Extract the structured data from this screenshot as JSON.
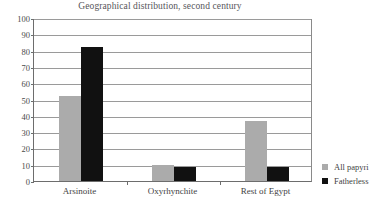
{
  "chart_data": {
    "type": "bar",
    "title": "Geographical distribution, second century",
    "xlabel": "",
    "ylabel": "",
    "categories": [
      "Arsinoite",
      "Oxyrhynchite",
      "Rest of Egypt"
    ],
    "series": [
      {
        "name": "All papyri",
        "color": "#ababab",
        "values": [
          52,
          10,
          37
        ]
      },
      {
        "name": "Fatherless",
        "color": "#111111",
        "values": [
          82,
          8.5,
          8.7
        ]
      }
    ],
    "ylim": [
      0,
      100
    ],
    "yticks": [
      0,
      10,
      20,
      30,
      40,
      50,
      60,
      70,
      80,
      90,
      100
    ],
    "ytick_labels": [
      "0",
      "10",
      "20",
      "30",
      "40",
      "50",
      "60",
      "70",
      "80",
      "90",
      "100"
    ],
    "grid": true,
    "legend_position": "right"
  },
  "legend": {
    "items": [
      {
        "label": "All papyri",
        "swatch": "gray-square-swatch"
      },
      {
        "label": "Fatherless",
        "swatch": "black-square-swatch"
      }
    ]
  }
}
